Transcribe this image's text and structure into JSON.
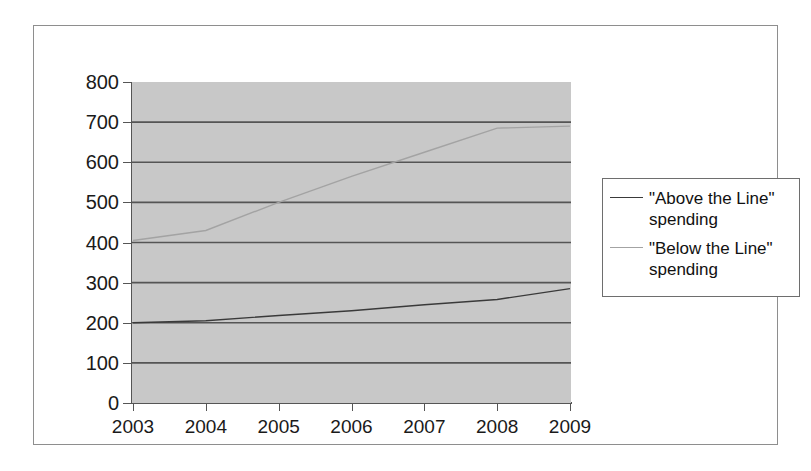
{
  "chart_data": {
    "type": "line",
    "title": "",
    "subtitle": "",
    "xlabel": "",
    "ylabel": "",
    "categories": [
      "2003",
      "2004",
      "2005",
      "2006",
      "2007",
      "2008",
      "2009"
    ],
    "x": [
      2003,
      2004,
      2005,
      2006,
      2007,
      2008,
      2009
    ],
    "ylim": [
      0,
      800
    ],
    "xlim": [
      2003,
      2009
    ],
    "y_ticks": [
      0,
      100,
      200,
      300,
      400,
      500,
      600,
      700,
      800
    ],
    "y_tick_labels": [
      "0",
      "100",
      "200",
      "300",
      "400",
      "500",
      "600",
      "700",
      "800"
    ],
    "grid": true,
    "grid_axis": "y",
    "legend_position": "right",
    "plot_background": "#c8c8c8",
    "figure_background": "#ffffff",
    "series": [
      {
        "name": "\"Above the Line\" spending",
        "color": "#3a3a3a",
        "values": [
          200,
          205,
          218,
          230,
          245,
          258,
          285
        ]
      },
      {
        "name": "\"Below the Line\" spending",
        "color": "#a3a3a3",
        "values": [
          405,
          430,
          500,
          565,
          625,
          685,
          690
        ]
      }
    ]
  },
  "legend": {
    "entries": [
      {
        "label": "\"Above the Line\" spending",
        "swatch": "swatch-above"
      },
      {
        "label": "\"Below the Line\" spending",
        "swatch": "swatch-below"
      }
    ]
  }
}
